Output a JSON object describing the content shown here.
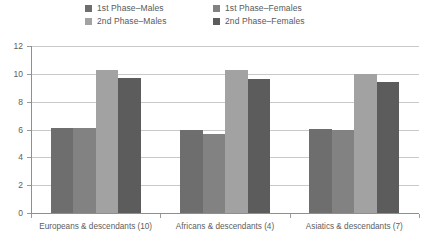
{
  "chart_data": {
    "type": "bar",
    "title": "",
    "subtitle": "",
    "xlabel": "",
    "ylabel": "",
    "ylim": [
      0,
      12
    ],
    "ytick_labels": [
      "12",
      "10",
      "8",
      "6",
      "4",
      "2",
      "0"
    ],
    "ytick_values": [
      12,
      10,
      8,
      6,
      4,
      2,
      0
    ],
    "grid": true,
    "legend_position": "top-center",
    "categories": [
      "Europeans & descendants (10)",
      "Africans & descendants (4)",
      "Asiatics & descendants (7)"
    ],
    "series": [
      {
        "name": "1st Phase–Males",
        "color": "#6e6e6e",
        "values": [
          6.1,
          5.95,
          6.05
        ]
      },
      {
        "name": "1st Phase–Females",
        "color": "#828282",
        "values": [
          6.1,
          5.7,
          5.95
        ]
      },
      {
        "name": "2nd Phase–Males",
        "color": "#a2a2a2",
        "values": [
          10.3,
          10.25,
          10.0
        ]
      },
      {
        "name": "2nd Phase–Females",
        "color": "#5c5c5c",
        "values": [
          9.7,
          9.6,
          9.4
        ]
      }
    ]
  },
  "legend": {
    "rows": [
      [
        {
          "label": "1st Phase–Males",
          "color": "#6e6e6e"
        },
        {
          "label": "1st Phase–Females",
          "color": "#828282"
        }
      ],
      [
        {
          "label": "2nd Phase–Males",
          "color": "#a2a2a2"
        },
        {
          "label": "2nd Phase–Females",
          "color": "#5c5c5c"
        }
      ]
    ]
  },
  "axes": {
    "y_axis_color": "#8f8f8f",
    "x_axis_color": "#8f8f8f",
    "gridline_color": "#c9c9c9"
  }
}
